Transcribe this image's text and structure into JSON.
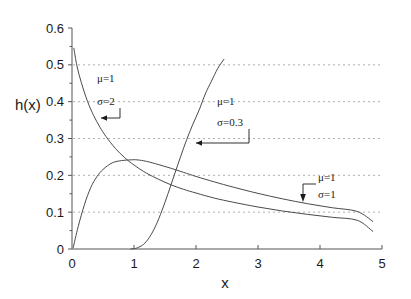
{
  "chart_data": {
    "type": "line",
    "title": "",
    "xlabel": "x",
    "ylabel": "h(x)",
    "xlim": [
      0,
      5
    ],
    "ylim": [
      0,
      0.6
    ],
    "grid": true,
    "grid_axis": "y",
    "legend_position": "inline-annotations",
    "xticks": [
      "0",
      "1",
      "2",
      "3",
      "4",
      "5"
    ],
    "xtick_values": [
      0,
      1,
      2,
      3,
      4,
      5
    ],
    "yticks": [
      "0",
      "0.1",
      "0.2",
      "0.3",
      "0.4",
      "0.5",
      "0.6"
    ],
    "ytick_values": [
      0,
      0.1,
      0.2,
      0.3,
      0.4,
      0.5,
      0.6
    ],
    "gridline_values": [
      0.1,
      0.2,
      0.3,
      0.4,
      0.5
    ],
    "series": [
      {
        "name": "mu=1, sigma=2",
        "mu": 1,
        "sigma": 2,
        "x": [
          0.03,
          0.08,
          0.15,
          0.25,
          0.35,
          0.45,
          0.55,
          0.7,
          0.85,
          1.0,
          1.2,
          1.4,
          1.6,
          1.8,
          2.0,
          2.3,
          2.6,
          3.0,
          3.4,
          3.8,
          4.2,
          4.6,
          4.85
        ],
        "y": [
          0.545,
          0.497,
          0.452,
          0.401,
          0.362,
          0.331,
          0.305,
          0.273,
          0.248,
          0.228,
          0.206,
          0.189,
          0.174,
          0.162,
          0.152,
          0.138,
          0.127,
          0.114,
          0.103,
          0.094,
          0.086,
          0.078,
          0.048
        ]
      },
      {
        "name": "mu=1, sigma=1",
        "mu": 1,
        "sigma": 1,
        "x": [
          0.02,
          0.1,
          0.2,
          0.3,
          0.4,
          0.5,
          0.65,
          0.8,
          0.95,
          1.05,
          1.2,
          1.4,
          1.6,
          1.8,
          2.0,
          2.3,
          2.6,
          3.0,
          3.4,
          3.8,
          4.2,
          4.6,
          4.85
        ],
        "y": [
          0.004,
          0.061,
          0.12,
          0.166,
          0.196,
          0.216,
          0.234,
          0.24,
          0.242,
          0.242,
          0.238,
          0.229,
          0.219,
          0.208,
          0.197,
          0.182,
          0.168,
          0.151,
          0.136,
          0.123,
          0.112,
          0.102,
          0.075
        ]
      },
      {
        "name": "mu=1, sigma=0.3",
        "mu": 1,
        "sigma": 0.3,
        "x": [
          0.95,
          1.0,
          1.05,
          1.15,
          1.25,
          1.35,
          1.45,
          1.55,
          1.65,
          1.75,
          1.85,
          1.95,
          2.05,
          2.15,
          2.25,
          2.35,
          2.45
        ],
        "y": [
          0.0,
          0.001,
          0.003,
          0.012,
          0.032,
          0.063,
          0.104,
          0.151,
          0.201,
          0.25,
          0.297,
          0.339,
          0.377,
          0.421,
          0.456,
          0.49,
          0.515
        ]
      }
    ],
    "annotations": [
      {
        "id": "annot-sigma-2",
        "line1": "μ=1",
        "line2": "σ=2",
        "target_x": 0.43,
        "target_y": 0.32
      },
      {
        "id": "annot-sigma-03",
        "line1": "μ=1",
        "line2": "σ=0.3",
        "target_x": 1.78,
        "target_y": 0.284
      },
      {
        "id": "annot-sigma-1",
        "line1": "μ=1",
        "line2": "σ=1",
        "target_x": 3.52,
        "target_y": 0.152
      }
    ],
    "colors": {
      "curve": "#4a4a4a",
      "grid": "#9a9a9a",
      "axis": "#555555",
      "text": "#1a1a1a",
      "background": "#ffffff"
    }
  }
}
